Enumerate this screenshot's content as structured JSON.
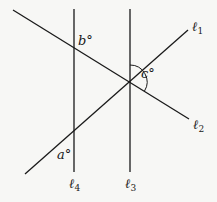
{
  "diagram": {
    "colors": {
      "line": "#1a1a1a",
      "background": "#f7f7f5"
    },
    "lines": [
      {
        "id": "l1",
        "name": "ℓ",
        "sub": "1",
        "x1": 25,
        "y1": 174,
        "x2": 188,
        "y2": 30
      },
      {
        "id": "l2",
        "name": "ℓ",
        "sub": "2",
        "x1": 13,
        "y1": 10,
        "x2": 189,
        "y2": 119
      },
      {
        "id": "l3",
        "name": "ℓ",
        "sub": "3",
        "x1": 130,
        "y1": 9,
        "x2": 130,
        "y2": 172
      },
      {
        "id": "l4",
        "name": "ℓ",
        "sub": "4",
        "x1": 74,
        "y1": 9,
        "x2": 74,
        "y2": 172
      }
    ],
    "angles": [
      {
        "id": "a",
        "label": "a°"
      },
      {
        "id": "b",
        "label": "b°"
      },
      {
        "id": "c",
        "label": "c°"
      }
    ],
    "line_labels": {
      "l1": {
        "main": "ℓ",
        "sub": "1"
      },
      "l2": {
        "main": "ℓ",
        "sub": "2"
      },
      "l3": {
        "main": "ℓ",
        "sub": "3"
      },
      "l4": {
        "main": "ℓ",
        "sub": "4"
      }
    }
  }
}
